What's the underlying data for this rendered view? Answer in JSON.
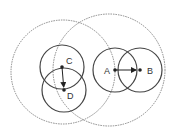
{
  "diagram": {
    "colors": {
      "background": "#ffffff",
      "solid_stroke": "#444444",
      "dashed_stroke": "#888888",
      "point": "#222222",
      "label": "#333333"
    },
    "large_circles": [
      {
        "id": "left-range",
        "cx": 63,
        "cy": 72,
        "r": 52,
        "style": "dashed"
      },
      {
        "id": "right-range",
        "cx": 109,
        "cy": 70,
        "r": 56,
        "style": "dashed"
      }
    ],
    "small_circles": [
      {
        "id": "C",
        "cx": 62,
        "cy": 67,
        "r": 22
      },
      {
        "id": "D",
        "cx": 64,
        "cy": 90,
        "r": 22
      },
      {
        "id": "A",
        "cx": 115,
        "cy": 70,
        "r": 22
      },
      {
        "id": "B",
        "cx": 140,
        "cy": 70,
        "r": 22
      }
    ],
    "points": [
      {
        "label": "C",
        "x": 62,
        "y": 67
      },
      {
        "label": "D",
        "x": 64,
        "y": 90
      },
      {
        "label": "A",
        "x": 115,
        "y": 70
      },
      {
        "label": "B",
        "x": 140,
        "y": 70
      }
    ],
    "arrows": [
      {
        "from": "C",
        "to": "D"
      },
      {
        "from": "A",
        "to": "B"
      }
    ],
    "labels": {
      "A": "A",
      "B": "B",
      "C": "C",
      "D": "D"
    }
  }
}
